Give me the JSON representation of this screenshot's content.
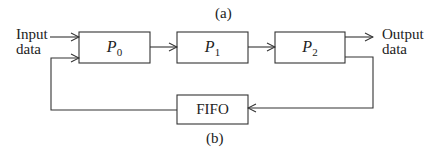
{
  "caption_top": "(a)",
  "caption_bottom": "(b)",
  "input_label": {
    "line1": "Input",
    "line2": "data"
  },
  "output_label": {
    "line1": "Output",
    "line2": "data"
  },
  "processors": [
    {
      "name": "P",
      "sub": "0"
    },
    {
      "name": "P",
      "sub": "1"
    },
    {
      "name": "P",
      "sub": "2"
    }
  ],
  "buffer": {
    "label": "FIFO"
  },
  "colors": {
    "stroke": "#333333",
    "background": "#ffffff"
  }
}
